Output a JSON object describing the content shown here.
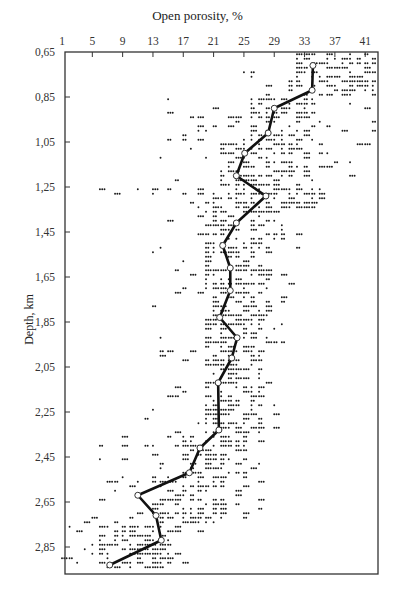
{
  "chart_data": {
    "type": "scatter",
    "title": "",
    "xlabel": "Open porosity, %",
    "ylabel": "Depth, km",
    "x_axis_position": "top",
    "y_axis_inverted": true,
    "xlim": [
      1,
      42.6
    ],
    "ylim": [
      0.65,
      3.0
    ],
    "x_ticks": [
      1,
      5,
      9,
      13,
      17,
      21,
      25,
      29,
      33,
      37,
      41
    ],
    "x_tick_labels": [
      "1",
      "5",
      "9",
      "13",
      "17",
      "21",
      "25",
      "29",
      "33",
      "37",
      "41"
    ],
    "y_ticks": [
      0.65,
      0.85,
      1.05,
      1.25,
      1.45,
      1.65,
      1.85,
      2.05,
      2.25,
      2.45,
      2.65,
      2.85
    ],
    "y_tick_labels": [
      "0,65",
      "0,85",
      "1,05",
      "1,25",
      "1,45",
      "1,65",
      "1,85",
      "2,05",
      "2,25",
      "2,45",
      "2,65",
      "2,85"
    ],
    "grid": false,
    "legend": null,
    "series": [
      {
        "name": "Mean open porosity trend",
        "type": "line",
        "marker": "open-circle",
        "color": "#111111",
        "x": [
          34.1,
          34.0,
          29.0,
          28.2,
          25.1,
          24.0,
          27.9,
          24.0,
          22.2,
          23.2,
          23.2,
          21.8,
          24.1,
          23.4,
          21.6,
          21.7,
          19.2,
          17.8,
          11.0,
          13.4,
          14.1,
          7.3
        ],
        "y": [
          0.71,
          0.82,
          0.9,
          1.01,
          1.1,
          1.2,
          1.29,
          1.41,
          1.51,
          1.61,
          1.71,
          1.83,
          1.92,
          2.01,
          2.12,
          2.33,
          2.41,
          2.52,
          2.62,
          2.71,
          2.82,
          2.93
        ]
      },
      {
        "name": "Sample measurements",
        "type": "scatter",
        "marker": "dot",
        "color": "#111111",
        "density_bands": [
          {
            "depth": [
              0.65,
              0.85
            ],
            "core": [
              31,
              42
            ],
            "spread": [
              25,
              42.5
            ]
          },
          {
            "depth": [
              0.85,
              1.05
            ],
            "core": [
              26,
              34
            ],
            "spread": [
              14,
              42
            ]
          },
          {
            "depth": [
              1.05,
              1.25
            ],
            "core": [
              22,
              33
            ],
            "spread": [
              14,
              42.5
            ]
          },
          {
            "depth": [
              1.25,
              1.35
            ],
            "core": [
              19,
              35
            ],
            "spread": [
              6,
              36
            ]
          },
          {
            "depth": [
              1.35,
              1.65
            ],
            "core": [
              20,
              29
            ],
            "spread": [
              13,
              32
            ]
          },
          {
            "depth": [
              1.65,
              1.85
            ],
            "core": [
              20,
              28
            ],
            "spread": [
              13,
              31
            ]
          },
          {
            "depth": [
              1.85,
              2.05
            ],
            "core": [
              20,
              27
            ],
            "spread": [
              13,
              30
            ]
          },
          {
            "depth": [
              2.05,
              2.35
            ],
            "core": [
              20,
              27
            ],
            "spread": [
              12,
              29
            ]
          },
          {
            "depth": [
              2.35,
              2.55
            ],
            "core": [
              17,
              25
            ],
            "spread": [
              6,
              28
            ]
          },
          {
            "depth": [
              2.55,
              2.75
            ],
            "core": [
              13,
              22
            ],
            "spread": [
              2,
              27
            ]
          },
          {
            "depth": [
              2.75,
              2.96
            ],
            "core": [
              6,
              16
            ],
            "spread": [
              1,
              20
            ]
          }
        ]
      }
    ]
  }
}
